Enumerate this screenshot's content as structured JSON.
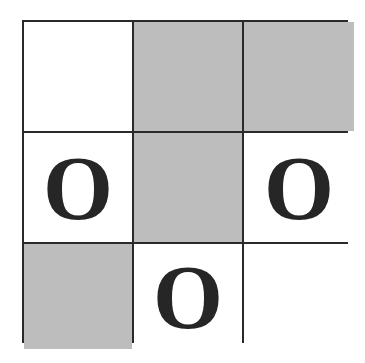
{
  "game": {
    "type": "tic-tac-toe",
    "colors": {
      "line": "#2a2a2a",
      "empty": "#ffffff",
      "shaded": "#bdbdbd",
      "mark": "#262626"
    },
    "cells": [
      {
        "row": 0,
        "col": 0,
        "mark": "",
        "shaded": false
      },
      {
        "row": 0,
        "col": 1,
        "mark": "",
        "shaded": true
      },
      {
        "row": 0,
        "col": 2,
        "mark": "",
        "shaded": true
      },
      {
        "row": 1,
        "col": 0,
        "mark": "O",
        "shaded": false
      },
      {
        "row": 1,
        "col": 1,
        "mark": "",
        "shaded": true
      },
      {
        "row": 1,
        "col": 2,
        "mark": "O",
        "shaded": false
      },
      {
        "row": 2,
        "col": 0,
        "mark": "",
        "shaded": true
      },
      {
        "row": 2,
        "col": 1,
        "mark": "O",
        "shaded": false
      },
      {
        "row": 2,
        "col": 2,
        "mark": "",
        "shaded": false
      }
    ]
  }
}
